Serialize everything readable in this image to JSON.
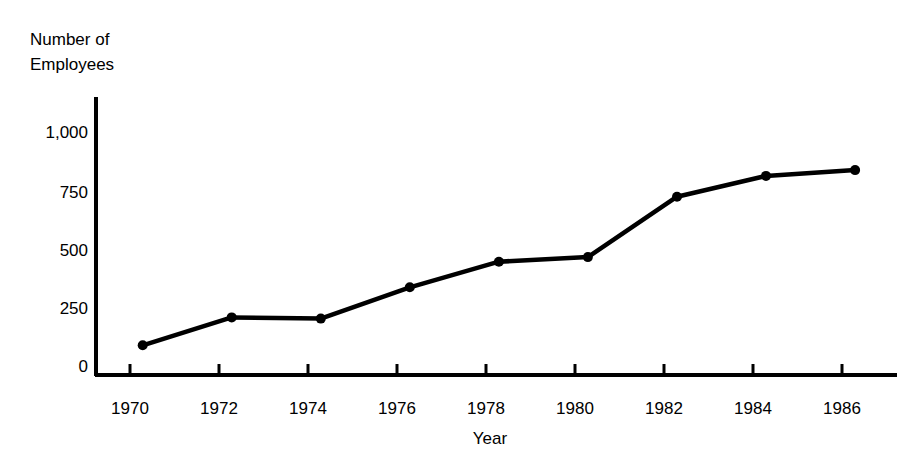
{
  "chart_data": {
    "type": "line",
    "title": "",
    "xlabel": "Year",
    "ylabel": "Number of Employees",
    "ylabel_lines": [
      "Number of",
      "Employees"
    ],
    "x": [
      1970,
      1972,
      1974,
      1976,
      1978,
      1980,
      1982,
      1984,
      1986
    ],
    "values": [
      85,
      205,
      200,
      335,
      445,
      465,
      725,
      815,
      840
    ],
    "series": [
      {
        "name": "Number of Employees",
        "values": [
          85,
          205,
          200,
          335,
          445,
          465,
          725,
          815,
          840
        ]
      }
    ],
    "xtick_labels": [
      "1970",
      "1972",
      "1974",
      "1976",
      "1978",
      "1980",
      "1982",
      "1984",
      "1986"
    ],
    "ytick_labels": [
      "0",
      "250",
      "500",
      "750",
      "1,000"
    ],
    "ytick_values": [
      0,
      250,
      500,
      750,
      1000
    ],
    "xlim": [
      1969.3,
      1987.2
    ],
    "ylim": [
      0,
      1010
    ],
    "grid": false,
    "legend": false,
    "marker": "filled-circle",
    "line_color": "#000000",
    "marker_color": "#000000",
    "background_color": "#ffffff"
  },
  "axes": {
    "y_axis_title_line1": "Number of",
    "y_axis_title_line2": "Employees",
    "x_axis_title": "Year"
  }
}
